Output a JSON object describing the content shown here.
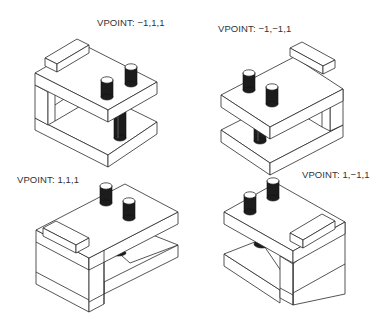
{
  "figure": {
    "views": [
      {
        "label": "VPOINT:  −1,1,1",
        "vpoint": "-1,1,1",
        "position": "top-left"
      },
      {
        "label": "VPOINT:  −1,−1,1",
        "vpoint": "-1,-1,1",
        "position": "top-right"
      },
      {
        "label": "VPOINT:  1,1,1",
        "vpoint": "1,1,1",
        "position": "bottom-left"
      },
      {
        "label": "VPOINT:  1,−1,1",
        "vpoint": "1,-1,1",
        "position": "bottom-right"
      }
    ]
  },
  "colors": {
    "line": "#2a2a2a",
    "background": "#ffffff",
    "pin_fill": "#1c1c1c",
    "text": "#333333"
  }
}
